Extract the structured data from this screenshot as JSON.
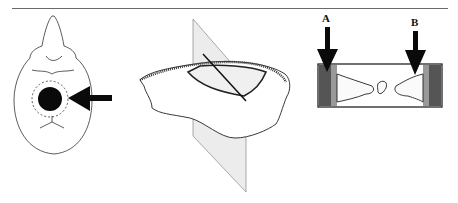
{
  "figure": {
    "panels": [
      {
        "id": "skull-top-view",
        "description": "dorsal view of skull with circular craniotomy marked by black disc inside dashed circle, arrow pointing at it"
      },
      {
        "id": "skull-fragment-section",
        "description": "bone fragment sectioned by a transparent vertical plane with a diagonal line"
      },
      {
        "id": "bone-cross-section",
        "description": "rectangular cross section of bone with two labeled arrows",
        "labels": [
          "A",
          "B"
        ]
      }
    ],
    "labels": {
      "a": "A",
      "b": "B"
    },
    "colors": {
      "ink": "#111111",
      "rule": "#6a6a6a",
      "plane": "#e6e6e6",
      "hatch": "#555555"
    }
  }
}
